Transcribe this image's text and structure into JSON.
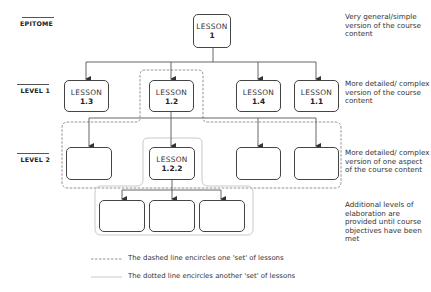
{
  "levels": [
    {
      "label": "EPITOME",
      "description": "Very general/simple version of the course content"
    },
    {
      "label": "LEVEL 1",
      "description": "More detailed/ complex version of the course content"
    },
    {
      "label": "LEVEL 2",
      "description": "More detailed/ complex version of one aspect of the course content"
    }
  ],
  "extra_description": "Additional levels of elaboration are provided until course objectives have been met",
  "nodes": {
    "epitome": {
      "title": "LESSON",
      "number": "1"
    },
    "level1": [
      {
        "title": "LESSON",
        "number": "1.3"
      },
      {
        "title": "LESSON",
        "number": "1.2"
      },
      {
        "title": "LESSON",
        "number": "1.4"
      },
      {
        "title": "LESSON",
        "number": "1.1"
      }
    ],
    "level2": [
      {
        "title": "",
        "number": ""
      },
      {
        "title": "LESSON",
        "number": "1.2.2"
      },
      {
        "title": "",
        "number": ""
      },
      {
        "title": "",
        "number": ""
      }
    ],
    "level3": [
      {
        "title": "",
        "number": ""
      },
      {
        "title": "",
        "number": ""
      },
      {
        "title": "",
        "number": ""
      }
    ]
  },
  "legend": {
    "dashed": "The dashed line encircles one 'set' of lessons",
    "dotted": "The dotted line encircles another 'set' of lessons"
  },
  "colors": {
    "box_stroke": "#444444",
    "connector": "#555555",
    "dashed_set": "#777777",
    "dotted_set": "#bbbbbb"
  }
}
